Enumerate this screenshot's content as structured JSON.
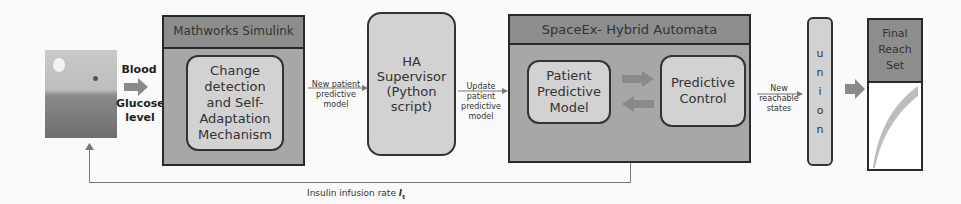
{
  "diagram": {
    "patient_input": {
      "line1": "Blood",
      "line2": "Glucose",
      "line3": "level"
    },
    "simulink": {
      "title": "Mathworks Simulink",
      "inner": [
        "Change",
        "detection",
        "and Self-",
        "Adaptation",
        "Mechanism"
      ]
    },
    "edge_new_model": [
      "New patient",
      "predictive",
      "model"
    ],
    "supervisor": [
      "HA",
      "Supervisor",
      "(Python",
      "script)"
    ],
    "edge_update": [
      "Update",
      "patient",
      "predictive",
      "model"
    ],
    "spaceex": {
      "title": "SpaceEx- Hybrid Automata",
      "patient_model": [
        "Patient",
        "Predictive",
        "Model"
      ],
      "control": [
        "Predictive",
        "Control"
      ]
    },
    "edge_reachable": [
      "New",
      "reachable",
      "states"
    ],
    "union": [
      "u",
      "n",
      "i",
      "o",
      "n"
    ],
    "final": [
      "Final",
      "Reach",
      "Set"
    ],
    "feedback": {
      "label": "Insulin infusion rate",
      "symbol": "I",
      "subscript": "t"
    }
  }
}
